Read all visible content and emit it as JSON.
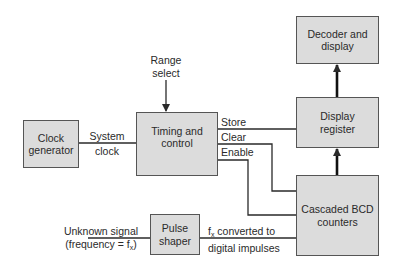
{
  "blocks": {
    "clock_generator": {
      "line1": "Clock",
      "line2": "generator"
    },
    "timing_control": {
      "line1": "Timing and",
      "line2": "control"
    },
    "decoder_display": {
      "line1": "Decoder and",
      "line2": "display"
    },
    "display_register": {
      "line1": "Display",
      "line2": "register"
    },
    "bcd_counters": {
      "line1": "Cascaded BCD",
      "line2": "counters"
    },
    "pulse_shaper": {
      "line1": "Pulse",
      "line2": "shaper"
    }
  },
  "labels": {
    "range_select": {
      "line1": "Range",
      "line2": "select"
    },
    "system_clock": {
      "line1": "System",
      "line2": "clock"
    },
    "store": "Store",
    "clear": "Clear",
    "enable": "Enable",
    "unknown_signal": {
      "line1": "Unknown signal",
      "line2_prefix": "(frequency = f",
      "line2_sub": "x",
      "line2_suffix": ")"
    },
    "fx_converted": {
      "line1_prefix": "f",
      "line1_sub": "x",
      "line1_suffix": " converted to",
      "line2": "digital impulses"
    }
  },
  "colors": {
    "box_fill": "#dcdcdc",
    "line": "#2a2a2a"
  }
}
